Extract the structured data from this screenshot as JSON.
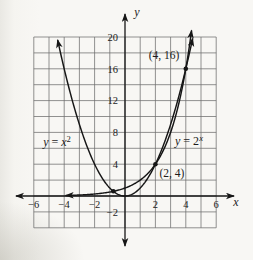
{
  "figure": {
    "background": "#f8f7f4",
    "ink_color": "#161616",
    "grid_color": "#6e6e6e"
  },
  "chart_data": {
    "type": "line",
    "title": "",
    "description_visible_text_only": true,
    "axes": {
      "x": {
        "label": "x",
        "min": -6,
        "max": 6,
        "grid_step": 1,
        "ticks": [
          -6,
          -4,
          -2,
          2,
          4,
          6
        ]
      },
      "y": {
        "label": "y",
        "min": -4,
        "max": 20,
        "grid_step": 2,
        "ticks": [
          20,
          16,
          12,
          8,
          4,
          -2
        ]
      }
    },
    "plot": {
      "x0": 125,
      "ux": 15.2,
      "y0": 196,
      "uy": 7.95
    },
    "grid": true,
    "series": [
      {
        "name": "y = x^2",
        "fn": "square",
        "domain": [
          -4.43,
          4.45
        ],
        "arrow_start": true,
        "arrow_end": true,
        "key_values": [
          {
            "x": -4,
            "y": 16
          },
          {
            "x": -2,
            "y": 4
          },
          {
            "x": 0,
            "y": 0
          },
          {
            "x": 2,
            "y": 4
          },
          {
            "x": 4,
            "y": 16
          }
        ]
      },
      {
        "name": "y = 2^x",
        "fn": "exp2",
        "domain": [
          -3.9,
          4.38
        ],
        "arrow_start": true,
        "arrow_end": true,
        "key_values": [
          {
            "x": -2,
            "y": 0.25
          },
          {
            "x": 0,
            "y": 1
          },
          {
            "x": 1,
            "y": 2
          },
          {
            "x": 2,
            "y": 4
          },
          {
            "x": 3,
            "y": 8
          },
          {
            "x": 4,
            "y": 16
          }
        ]
      }
    ],
    "marked_points": [
      {
        "x": -0.767,
        "y": 0.59,
        "label": ""
      },
      {
        "x": 2,
        "y": 4,
        "label": "(2, 4)"
      },
      {
        "x": 4,
        "y": 16,
        "label": "(4, 16)"
      }
    ],
    "annotations": [
      {
        "name": "point-label-4-16",
        "px": 164,
        "py": 59,
        "size": 11.5,
        "runs": [
          {
            "t": "(4, 16)",
            "i": 0
          }
        ]
      },
      {
        "name": "point-label-2-4",
        "px": 172,
        "py": 177,
        "size": 11.5,
        "runs": [
          {
            "t": "(2, 4)",
            "i": 0
          }
        ]
      },
      {
        "name": "curve-label-x-squared",
        "px": 57,
        "py": 146,
        "size": 12,
        "runs": [
          {
            "t": "y",
            "i": 1
          },
          {
            "t": " = ",
            "i": 0
          },
          {
            "t": "x",
            "i": 1
          },
          {
            "t": "2",
            "i": 0,
            "sup": 1
          }
        ]
      },
      {
        "name": "curve-label-2-to-x",
        "px": 189,
        "py": 145,
        "size": 12,
        "runs": [
          {
            "t": "y",
            "i": 1
          },
          {
            "t": " = 2",
            "i": 0
          },
          {
            "t": "x",
            "i": 1,
            "sup": 1
          }
        ]
      }
    ],
    "axis_label_pos": {
      "x": {
        "px": 236,
        "py": 206
      },
      "y": {
        "px": 137,
        "py": 16
      }
    },
    "style": {
      "curve_width": 1.45,
      "axis_width": 1.3,
      "grid_width": 0.75,
      "dot_radius": 2.3,
      "tick_font": 10.5,
      "grid_color": "#6e6e6e",
      "ink": "#161616"
    }
  }
}
